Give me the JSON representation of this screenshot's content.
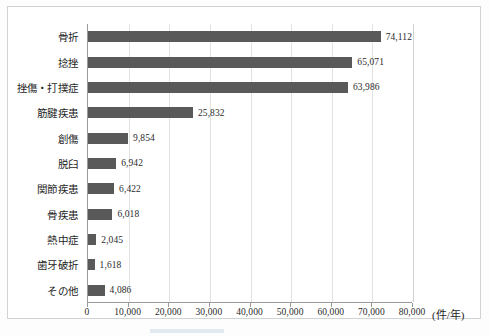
{
  "chart_data": {
    "type": "bar",
    "orientation": "horizontal",
    "title": "",
    "xlabel": "(件/年)",
    "ylabel": "",
    "xlim": [
      0,
      80000
    ],
    "xticks": [
      "0",
      "10,000",
      "20,000",
      "30,000",
      "40,000",
      "50,000",
      "60,000",
      "70,000",
      "80,000"
    ],
    "xtick_values": [
      0,
      10000,
      20000,
      30000,
      40000,
      50000,
      60000,
      70000,
      80000
    ],
    "grid": true,
    "grid_axis": "x",
    "legend": "none",
    "bar_color": "#595959",
    "categories": [
      "骨折",
      "捻挫",
      "挫傷・打撲症",
      "筋腱疾患",
      "創傷",
      "脱臼",
      "関節疾患",
      "骨疾患",
      "熱中症",
      "歯牙破折",
      "その他"
    ],
    "values": [
      74112,
      65071,
      63986,
      25832,
      9854,
      6942,
      6422,
      6018,
      2045,
      1618,
      4086
    ],
    "value_labels": [
      "74,112",
      "65,071",
      "63,986",
      "25,832",
      "9,854",
      "6,942",
      "6,422",
      "6,018",
      "2,045",
      "1,618",
      "4,086"
    ]
  }
}
